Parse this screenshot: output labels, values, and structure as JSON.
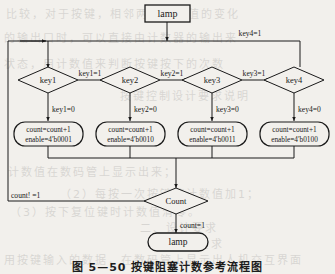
{
  "figure": {
    "caption": "图 5—50  按键阻塞计数参考流程图",
    "type": "flowchart"
  },
  "nodes": {
    "start": {
      "label": "lamp",
      "shape": "rectangle"
    },
    "end": {
      "label": "lamp",
      "shape": "stadium"
    },
    "decisions": [
      {
        "id": "key1",
        "label": "key1"
      },
      {
        "id": "key2",
        "label": "key2"
      },
      {
        "id": "key3",
        "label": "key3"
      },
      {
        "id": "key4",
        "label": "key4"
      }
    ],
    "count_decision": {
      "label": "Count"
    },
    "actions": [
      {
        "line1": "count=count+1",
        "line2": "enable=4′b0001"
      },
      {
        "line1": "count=count+1",
        "line2": "enable=4′b0010"
      },
      {
        "line1": "count=count+1",
        "line2": "enable=4′b0011"
      },
      {
        "line1": "count=count+1",
        "line2": "enable=4′b0100"
      }
    ]
  },
  "edges": {
    "key1_true": "key1=1",
    "key1_false": "key1=0",
    "key2_true": "key2=1",
    "key2_false": "key2=0",
    "key3_true": "key3=1",
    "key3_false": "key3=0",
    "key4_true": "key4=1",
    "key4_false": "key4=0",
    "count_false": "count! =1",
    "count_true": "count=1"
  },
  "colors": {
    "stroke": "#1a1a1a",
    "text": "#1a1a1a",
    "background": "#f2f0ec"
  },
  "bleed_text": [
    {
      "x": 6,
      "y": 2,
      "text": "比较，对于按键，相邻两次采样值的变化"
    },
    {
      "x": 4,
      "y": 26,
      "text": "的输出口时，可以直接由计数器的输出来"
    },
    {
      "x": 4,
      "y": 52,
      "text": "状态，用计数值来判断按键按下的次数"
    },
    {
      "x": 120,
      "y": 84,
      "text": "按键控制设计要求说明"
    },
    {
      "x": 8,
      "y": 160,
      "text": "计数值在数码管上显示出来；"
    },
    {
      "x": 60,
      "y": 182,
      "text": "（2）每按一次按键使计数值加1；"
    },
    {
      "x": 10,
      "y": 200,
      "text": "（3）按下复位键时计数值清零。"
    },
    {
      "x": 140,
      "y": 216,
      "text": "二、设计要求"
    },
    {
      "x": 150,
      "y": 232,
      "text": "1．基本要求"
    },
    {
      "x": 4,
      "y": 248,
      "text": "用按键输入的数据，在数码管上显示出人机交互界面"
    }
  ]
}
